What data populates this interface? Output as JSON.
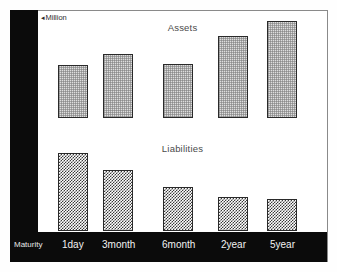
{
  "figure": {
    "unit_label": "Million",
    "unit_arrow_icon": "left-triangle-icon",
    "maturity_axis_label": "Maturity"
  },
  "panels": [
    {
      "key": "assets",
      "title": "Assets"
    },
    {
      "key": "liabilities",
      "title": "Liabilities"
    }
  ],
  "chart_data": {
    "type": "bar",
    "title": "",
    "xlabel": "Maturity",
    "ylabel": "Million",
    "grid": false,
    "legend": "none",
    "categories": [
      "1day",
      "3month",
      "6month",
      "2year",
      "5year"
    ],
    "panels": [
      {
        "name": "Assets",
        "ylabel": "Million",
        "ylim": [
          0,
          11
        ],
        "values": [
          5.4,
          6.6,
          5.5,
          8.4,
          10.0
        ]
      },
      {
        "name": "Liabilities",
        "ylabel": "Million",
        "ylim": [
          0,
          11
        ],
        "values": [
          7.7,
          6.0,
          4.3,
          3.3,
          3.1
        ]
      }
    ]
  },
  "colors": {
    "sidebar": "#0b0b0b",
    "axis_band": "#0b0b0b",
    "frame": "#8a8a8a",
    "bar_border": "#2a2a2a",
    "assets_fill": "#dedede",
    "liabilities_fill": "#3a3a3a",
    "title_text": "#4a4a4a",
    "axis_text": "#f2f2f2"
  }
}
